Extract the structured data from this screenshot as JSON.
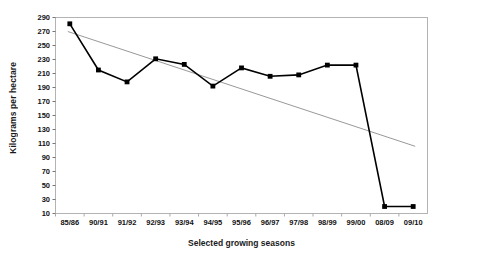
{
  "chart_data": {
    "type": "line",
    "title": "",
    "xlabel": "Selected growing seasons",
    "ylabel": "Kilograms per hectare",
    "categories": [
      "85/86",
      "90/91",
      "91/92",
      "92/93",
      "93/94",
      "94/95",
      "95/96",
      "96/97",
      "97/98",
      "98/99",
      "99/00",
      "08/09",
      "09/10"
    ],
    "ylim": [
      10,
      290
    ],
    "y_ticks": [
      10,
      30,
      50,
      70,
      90,
      110,
      130,
      150,
      170,
      190,
      210,
      230,
      250,
      270,
      290
    ],
    "grid": false,
    "legend": "none",
    "series": [
      {
        "name": "Yield",
        "type": "line",
        "marker": "square",
        "color": "#000000",
        "values": [
          281,
          215,
          198,
          231,
          223,
          192,
          218,
          206,
          208,
          222,
          222,
          20,
          20
        ]
      },
      {
        "name": "Linear trend",
        "type": "trendline",
        "marker": "none",
        "color": "#999999",
        "endpoints": [
          270,
          106
        ]
      }
    ]
  },
  "axes": {
    "y_tick_labels": [
      "290",
      "270",
      "250",
      "230",
      "210",
      "190",
      "170",
      "150",
      "130",
      "110",
      "90",
      "70",
      "50",
      "30",
      "10"
    ],
    "x_tick_labels": [
      "85/86",
      "90/91",
      "91/92",
      "92/93",
      "93/94",
      "94/95",
      "95/96",
      "96/97",
      "97/98",
      "98/99",
      "99/00",
      "08/09",
      "09/10"
    ]
  }
}
